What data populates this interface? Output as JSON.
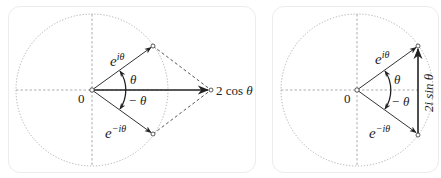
{
  "figure": {
    "panels": [
      {
        "id": "cosine-sum",
        "labels": {
          "origin": "0",
          "upper_vector": "e",
          "upper_exp": "iθ",
          "lower_vector": "e",
          "lower_exp": "−iθ",
          "angle_pos": "θ",
          "angle_neg": "− θ",
          "result_coef": "2 cos ",
          "result_var": "θ"
        }
      },
      {
        "id": "sine-difference",
        "labels": {
          "origin": "0",
          "upper_vector": "e",
          "upper_exp": "iθ",
          "lower_vector": "e",
          "lower_exp": "−iθ",
          "angle_pos": "θ",
          "angle_neg": "− θ",
          "result": "2i sin θ"
        }
      }
    ],
    "colors": {
      "stroke": "#333333",
      "guide": "#9a9a9a",
      "panel_border": "#ececec"
    }
  }
}
